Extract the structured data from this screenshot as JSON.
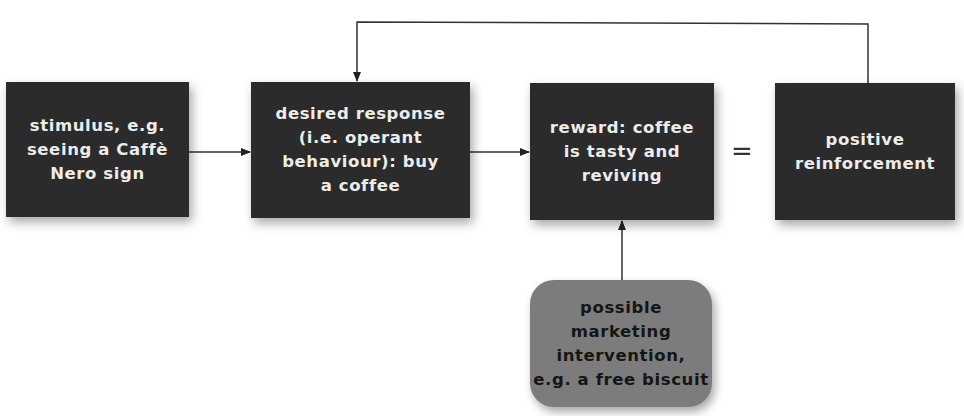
{
  "diagram": {
    "nodes": [
      {
        "id": "stimulus",
        "label": "stimulus, e.g.\nseeing a Caffè\nNero sign",
        "style": "dark"
      },
      {
        "id": "desired-response",
        "label": "desired response\n(i.e. operant\nbehaviour): buy\na coffee",
        "style": "dark"
      },
      {
        "id": "reward",
        "label": "reward: coffee\nis tasty and\nreviving",
        "style": "dark"
      },
      {
        "id": "positive-reinforcement",
        "label": "positive\nreinforcement",
        "style": "dark"
      },
      {
        "id": "marketing-intervention",
        "label": "possible\nmarketing\nintervention,\ne.g. a free biscuit",
        "style": "rounded-grey"
      }
    ],
    "equals_symbol": "=",
    "edges": [
      {
        "from": "stimulus",
        "to": "desired-response",
        "type": "arrow"
      },
      {
        "from": "desired-response",
        "to": "reward",
        "type": "arrow"
      },
      {
        "from": "reward",
        "to": "positive-reinforcement",
        "type": "equals"
      },
      {
        "from": "positive-reinforcement",
        "to": "desired-response",
        "type": "feedback-arrow"
      },
      {
        "from": "marketing-intervention",
        "to": "reward",
        "type": "arrow"
      }
    ],
    "colors": {
      "box_dark": "#2b2b2b",
      "box_text_light": "#ececec",
      "box_grey": "#7c7c7c",
      "box_text_dark": "#151515",
      "line": "#333333"
    }
  }
}
